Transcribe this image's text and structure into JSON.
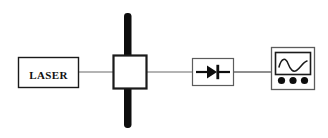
{
  "figure": {
    "background_color": "#ffffff",
    "line_color": "#555555",
    "stroke_color": "#111111",
    "fill_color": "#ffffff"
  },
  "components": {
    "laser": {
      "label": "LASER",
      "name": "laser-source",
      "x": 18,
      "y": 57,
      "width": 60,
      "height": 30
    },
    "modulator": {
      "label": "",
      "name": "modulator-cell",
      "x": 113,
      "y": 55,
      "width": 34,
      "height": 34
    },
    "beam_bar": {
      "label": "",
      "name": "vertical-beam-bar",
      "x": 124,
      "y": 13,
      "width": 8,
      "height": 115
    },
    "detector": {
      "label": "",
      "name": "photodiode-detector",
      "x": 192,
      "y": 58,
      "width": 42,
      "height": 28
    },
    "oscilloscope": {
      "label": "",
      "name": "oscilloscope",
      "x": 271,
      "y": 47,
      "width": 44,
      "height": 43,
      "knob_count": 3
    }
  },
  "connections": [
    {
      "name": "laser-to-modulator",
      "from": "laser",
      "to": "modulator",
      "x1": 78,
      "x2": 113,
      "y": 72
    },
    {
      "name": "modulator-to-detector",
      "from": "modulator",
      "to": "detector",
      "x1": 147,
      "x2": 192,
      "y": 72
    },
    {
      "name": "detector-to-oscilloscope",
      "from": "detector",
      "to": "oscilloscope",
      "x1": 234,
      "x2": 271,
      "y": 72
    }
  ],
  "icons": {
    "diode_symbol": "diode-icon",
    "waveform": "sine-waveform-icon",
    "knob": "knob-icon"
  }
}
